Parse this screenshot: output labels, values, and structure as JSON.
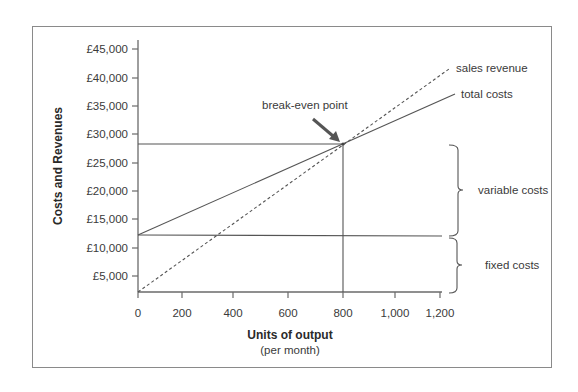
{
  "chart_data": {
    "type": "line",
    "title": "",
    "xlabel": "Units of output",
    "xlabel_sub": "(per month)",
    "ylabel": "Costs and Revenues",
    "x_ticks": [
      "0",
      "200",
      "400",
      "600",
      "800",
      "1,000",
      "1,200"
    ],
    "y_ticks": [
      "£5,000",
      "£10,000",
      "£15,000",
      "£20,000",
      "£25,000",
      "£30,000",
      "£35,000",
      "£40,000",
      "£45,000"
    ],
    "xlim": [
      0,
      1200
    ],
    "ylim": [
      2200,
      45000
    ],
    "grid": false,
    "series": [
      {
        "name": "sales revenue",
        "style": "dashed",
        "points": [
          [
            0,
            2200
          ],
          [
            800,
            28300
          ],
          [
            1220,
            41700
          ]
        ]
      },
      {
        "name": "total costs",
        "style": "solid",
        "points": [
          [
            0,
            12200
          ],
          [
            800,
            28300
          ],
          [
            1245,
            37100
          ]
        ]
      },
      {
        "name": "fixed costs",
        "style": "solid",
        "points": [
          [
            0,
            12200
          ],
          [
            1200,
            12200
          ]
        ]
      }
    ],
    "annotations": [
      {
        "text": "break-even point",
        "x": 800,
        "y": 28300,
        "type": "arrow"
      },
      {
        "text": "sales revenue",
        "type": "line-label"
      },
      {
        "text": "total costs",
        "type": "line-label"
      },
      {
        "text": "variable costs",
        "type": "bracket",
        "range": [
          12200,
          28300
        ]
      },
      {
        "text": "fixed costs",
        "type": "bracket",
        "range": [
          2200,
          12200
        ]
      }
    ],
    "reference_lines": [
      {
        "orientation": "horizontal",
        "y": 28300,
        "from_x": 0,
        "to_x": 800
      },
      {
        "orientation": "vertical",
        "x": 800,
        "from_y": 2200,
        "to_y": 28300
      }
    ],
    "break_even": {
      "units": 800,
      "value": 28300
    }
  },
  "labels": {
    "y_axis": "Costs and Revenues",
    "x_axis": "Units of output",
    "x_axis_sub": "(per month)",
    "break_even": "break-even point",
    "sales_revenue": "sales revenue",
    "total_costs": "total costs",
    "variable_costs": "variable costs",
    "fixed_costs": "fixed costs"
  },
  "y_ticks": [
    {
      "label": "£45,000",
      "y": 49
    },
    {
      "label": "£40,000",
      "y": 78
    },
    {
      "label": "£35,000",
      "y": 106
    },
    {
      "label": "£30,000",
      "y": 134
    },
    {
      "label": "£25,000",
      "y": 163
    },
    {
      "label": "£20,000",
      "y": 191
    },
    {
      "label": "£15,000",
      "y": 219
    },
    {
      "label": "£10,000",
      "y": 248
    },
    {
      "label": "£5,000",
      "y": 276
    }
  ],
  "x_ticks": [
    {
      "label": "0",
      "x": 138
    },
    {
      "label": "200",
      "x": 182
    },
    {
      "label": "400",
      "x": 233
    },
    {
      "label": "600",
      "x": 288
    },
    {
      "label": "800",
      "x": 343
    },
    {
      "label": "1,000",
      "x": 395
    },
    {
      "label": "1,200",
      "x": 440
    }
  ],
  "colors": {
    "line": "#555555",
    "axis": "#6a6a6a",
    "text": "#333333",
    "frame": "#8a8a8a"
  }
}
